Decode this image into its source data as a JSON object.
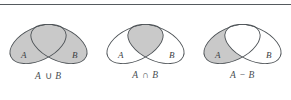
{
  "figure": {
    "name": "set-operations-venn-diagrams",
    "top_rule": true,
    "colors": {
      "shade": "#c9c9c9",
      "stroke": "#4d5256",
      "rule": "#555a5e",
      "label": "#4a4f53",
      "background": "#ffffff"
    },
    "panels": [
      {
        "id": "union",
        "caption": "A ∪ B",
        "caption_left": "A",
        "caption_op": "∪",
        "caption_right": "B",
        "set_labels": {
          "a": "A",
          "b": "B"
        },
        "shaded_region": "both-ellipses",
        "description": "Union of A and B: entire area of both ellipses shaded"
      },
      {
        "id": "intersection",
        "caption": "A ∩ B",
        "caption_left": "A",
        "caption_op": "∩",
        "caption_right": "B",
        "set_labels": {
          "a": "A",
          "b": "B"
        },
        "shaded_region": "overlap-only",
        "description": "Intersection of A and B: only the overlapping lens shaded"
      },
      {
        "id": "difference",
        "caption": "A − B",
        "caption_left": "A",
        "caption_op": "−",
        "caption_right": "B",
        "set_labels": {
          "a": "A",
          "b": "B"
        },
        "shaded_region": "a-minus-overlap",
        "description": "Difference A minus B: ellipse A shaded except the overlap"
      }
    ]
  }
}
